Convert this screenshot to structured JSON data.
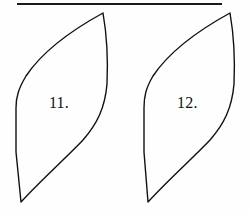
{
  "page": {
    "width": 251,
    "height": 214,
    "background_color": "#fefefe",
    "ink_color": "#111111"
  },
  "divider": {
    "name": "horizontal-rule",
    "x1": 17,
    "x2": 222,
    "y": 4,
    "thickness": 2,
    "color": "#1a1a1a"
  },
  "figures": [
    {
      "label": "11.",
      "shape": "lens-leaf-outline",
      "fill": "none",
      "stroke": "#111111",
      "stroke_width": 1.4,
      "top_apex": {
        "x": 103,
        "y": 13
      },
      "bottom_apex": {
        "x": 21,
        "y": 202
      },
      "left_bulge_x": 16,
      "right_bulge_x": 107,
      "label_position": {
        "x": 49,
        "y": 95
      }
    },
    {
      "label": "12.",
      "shape": "lens-leaf-outline",
      "fill": "none",
      "stroke": "#111111",
      "stroke_width": 1.4,
      "top_apex": {
        "x": 230,
        "y": 13
      },
      "bottom_apex": {
        "x": 148,
        "y": 202
      },
      "left_bulge_x": 144,
      "right_bulge_x": 234,
      "label_position": {
        "x": 177,
        "y": 95
      }
    }
  ]
}
